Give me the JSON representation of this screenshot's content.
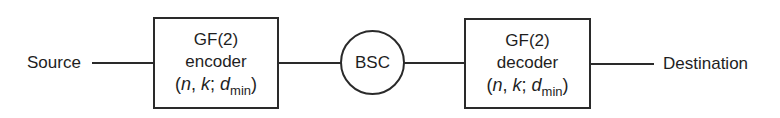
{
  "diagram": {
    "source": {
      "label": "Source"
    },
    "encoder": {
      "line1": "GF(2)",
      "line2": "encoder",
      "params": {
        "open": "(",
        "n": "n",
        "sep1": ", ",
        "k": "k",
        "sep2": "; ",
        "d": "d",
        "sub": "min",
        "close": ")"
      }
    },
    "channel": {
      "label": "BSC"
    },
    "decoder": {
      "line1": "GF(2)",
      "line2": "decoder",
      "params": {
        "open": "(",
        "n": "n",
        "sep1": ", ",
        "k": "k",
        "sep2": "; ",
        "d": "d",
        "sub": "min",
        "close": ")"
      }
    },
    "destination": {
      "label": "Destination"
    },
    "edges": [
      {
        "from": "Source",
        "to": "GF(2) encoder"
      },
      {
        "from": "GF(2) encoder",
        "to": "BSC"
      },
      {
        "from": "BSC",
        "to": "GF(2) decoder"
      },
      {
        "from": "GF(2) decoder",
        "to": "Destination"
      }
    ]
  }
}
